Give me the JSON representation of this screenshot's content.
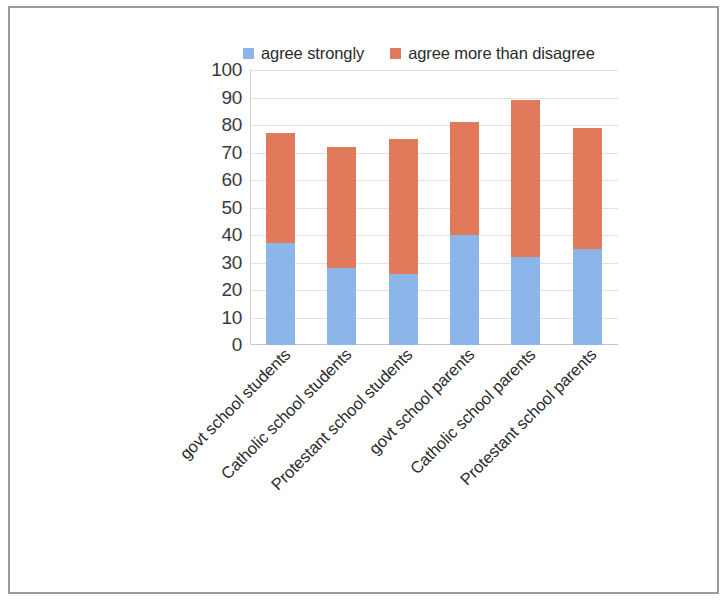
{
  "chart_data": {
    "type": "bar",
    "subtype": "stacked-vertical",
    "title": "",
    "xlabel": "",
    "ylabel": "",
    "ylim": [
      0,
      100
    ],
    "ytick_step": 10,
    "yticks": [
      "100",
      "90",
      "80",
      "70",
      "60",
      "50",
      "40",
      "30",
      "20",
      "10",
      "0"
    ],
    "grid": true,
    "legend_position": "top",
    "categories": [
      "govt school students",
      "Catholic school students",
      "Protestant school students",
      "govt school parents",
      "Catholic school parents",
      "Protestant school parents"
    ],
    "series": [
      {
        "name": "agree strongly",
        "color": "#8cb6ea",
        "values": [
          37,
          28,
          26,
          40,
          32,
          35
        ]
      },
      {
        "name": "agree more than disagree",
        "color": "#e07a5b",
        "values": [
          40,
          44,
          49,
          41,
          57,
          44
        ]
      }
    ],
    "totals": [
      77,
      72,
      75,
      81,
      89,
      79
    ]
  },
  "legend": {
    "items": [
      {
        "label": "agree strongly",
        "color": "#8cb6ea",
        "swatch": "legend-swatch-blue"
      },
      {
        "label": "agree more than disagree",
        "color": "#e07a5b",
        "swatch": "legend-swatch-orange"
      }
    ]
  }
}
